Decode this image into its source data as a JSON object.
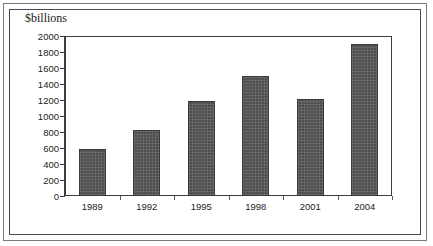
{
  "chart_data": {
    "type": "bar",
    "title": "$billions",
    "xlabel": "",
    "ylabel": "",
    "categories": [
      "1989",
      "1992",
      "1995",
      "1998",
      "2001",
      "2004"
    ],
    "values": [
      585,
      820,
      1190,
      1500,
      1210,
      1895
    ],
    "series": [
      {
        "name": "$billions",
        "values": [
          585,
          820,
          1190,
          1500,
          1210,
          1895
        ]
      }
    ],
    "ylim": [
      0,
      2000
    ],
    "ytick_labels": [
      "2000",
      "1800",
      "1600",
      "1400",
      "1200",
      "1000",
      "800",
      "600",
      "400",
      "200",
      "0"
    ],
    "ytick_values": [
      2000,
      1800,
      1600,
      1400,
      1200,
      1000,
      800,
      600,
      400,
      200,
      0
    ],
    "ytick_step": 200,
    "grid": false,
    "legend": false,
    "legend_position": "none",
    "bar_color": "#4f4f4f",
    "axis_color": "#3d3d3d",
    "background_color": "#ffffff",
    "frame": {
      "outer_border_color": "#7a7a7a",
      "inner_border_color": "#4a4a4a"
    }
  }
}
